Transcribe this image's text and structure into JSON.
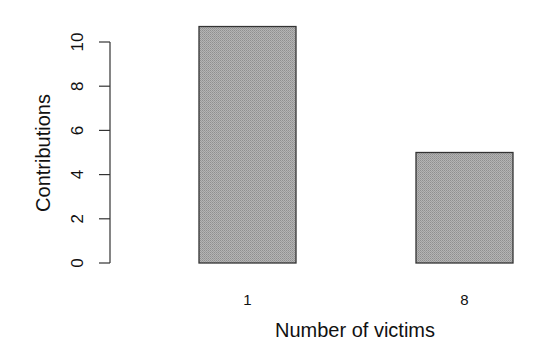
{
  "chart_data": {
    "type": "bar",
    "title": "",
    "xlabel": "Number of victims",
    "ylabel": "Contributions",
    "categories": [
      "1",
      "8"
    ],
    "values": [
      10.7,
      5
    ],
    "ylim": [
      0,
      10
    ],
    "yticks": [
      0,
      2,
      4,
      6,
      8,
      10
    ],
    "grid": false,
    "legend": null,
    "bar_color": "#a8a8a8",
    "bar_border": "#333333"
  }
}
